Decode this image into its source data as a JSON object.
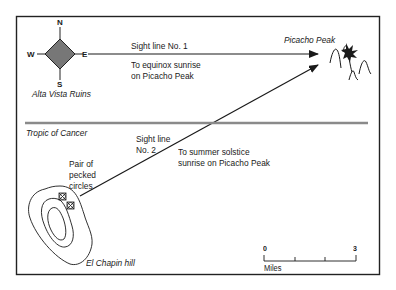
{
  "diagram": {
    "compass": {
      "north": "N",
      "south": "S",
      "east": "E",
      "west": "W",
      "fill": "#777777"
    },
    "places": {
      "origin": "Alta Vista Ruins",
      "target": "Picacho Peak",
      "hill": "El Chapin hill"
    },
    "sight_line_1": {
      "label": "Sight line No. 1",
      "description_line1": "To equinox sunrise",
      "description_line2": "on Picacho Peak"
    },
    "sight_line_2": {
      "label_line1": "Sight line",
      "label_line2": "No. 2",
      "description_line1": "To summer solstice",
      "description_line2": "sunrise on Picacho Peak"
    },
    "tropic": {
      "label": "Tropic of Cancer",
      "color": "#8a8a8a"
    },
    "marker": {
      "line1": "Pair of",
      "line2": "pecked",
      "line3": "circles"
    },
    "scale": {
      "min": "0",
      "max": "3",
      "unit": "Miles"
    }
  }
}
